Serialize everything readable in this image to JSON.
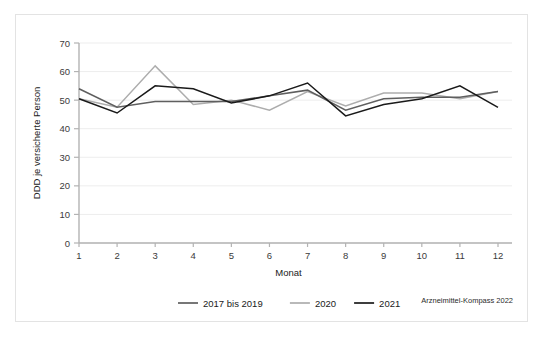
{
  "chart_data": {
    "type": "line",
    "title": "",
    "xlabel": "Monat",
    "ylabel": "DDD je versicherte Person",
    "categories": [
      "1",
      "2",
      "3",
      "4",
      "5",
      "6",
      "7",
      "8",
      "9",
      "10",
      "11",
      "12"
    ],
    "x": [
      1,
      2,
      3,
      4,
      5,
      6,
      7,
      8,
      9,
      10,
      11,
      12
    ],
    "xlim": [
      1,
      12
    ],
    "ylim": [
      0,
      70
    ],
    "yticks": [
      0,
      10,
      20,
      30,
      40,
      50,
      60,
      70
    ],
    "ytick_labels": [
      "0",
      "10",
      "20",
      "30",
      "40",
      "50",
      "60",
      "70"
    ],
    "xticks": [
      1,
      2,
      3,
      4,
      5,
      6,
      7,
      8,
      9,
      10,
      11,
      12
    ],
    "xtick_labels": [
      "1",
      "2",
      "3",
      "4",
      "5",
      "6",
      "7",
      "8",
      "9",
      "10",
      "11",
      "12"
    ],
    "grid": "horizontal",
    "legend_position": "bottom-center",
    "series": [
      {
        "name": "2017 bis 2019",
        "color": "#5f5f5f",
        "values": [
          54.0,
          47.5,
          49.5,
          49.5,
          49.5,
          51.5,
          53.5,
          46.5,
          50.5,
          51.0,
          51.0,
          53.0
        ]
      },
      {
        "name": "2020",
        "color": "#adadad",
        "values": [
          50.5,
          47.5,
          62.0,
          48.5,
          50.0,
          46.5,
          53.0,
          48.0,
          52.5,
          52.5,
          50.5,
          53.0
        ]
      },
      {
        "name": "2021",
        "color": "#1a1a1a",
        "values": [
          50.5,
          45.5,
          55.0,
          54.0,
          49.0,
          51.5,
          56.0,
          44.5,
          48.5,
          50.5,
          55.0,
          47.5
        ]
      }
    ]
  },
  "legend": {
    "items": [
      {
        "label": "2017 bis 2019",
        "color": "#5f5f5f"
      },
      {
        "label": "2020",
        "color": "#adadad"
      },
      {
        "label": "2021",
        "color": "#1a1a1a"
      }
    ]
  },
  "axes": {
    "x_title": "Monat",
    "y_title": "DDD je versicherte Person"
  },
  "source": {
    "text": "Arzneimittel-Kompass 2022"
  },
  "colors": {
    "frame": "#e3e3e3",
    "grid": "#ededed",
    "axis": "#b3b3b3",
    "background": "#ffffff"
  }
}
